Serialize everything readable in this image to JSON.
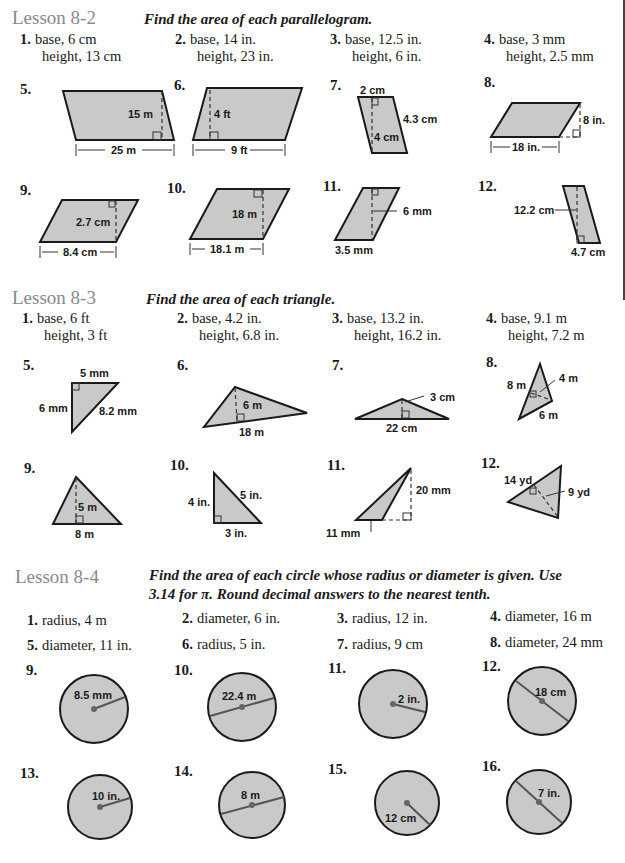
{
  "lessons": [
    {
      "title": "Lesson 8-2",
      "instruction": "Find the area of each parallelogram.",
      "items": [
        {
          "n": "1.",
          "line1": "base, 6 cm",
          "line2": "height, 13 cm"
        },
        {
          "n": "2.",
          "line1": "base, 14 in.",
          "line2": "height, 23 in."
        },
        {
          "n": "3.",
          "line1": "base, 12.5 in.",
          "line2": "height, 6 in."
        },
        {
          "n": "4.",
          "line1": "base, 3 mm",
          "line2": "height, 2.5 mm"
        }
      ],
      "figures": [
        {
          "n": "5.",
          "labels": [
            "15 m",
            "25 m"
          ]
        },
        {
          "n": "6.",
          "labels": [
            "4 ft",
            "9 ft"
          ]
        },
        {
          "n": "7.",
          "labels": [
            "2 cm",
            "4.3 cm",
            "4 cm"
          ]
        },
        {
          "n": "8.",
          "labels": [
            "8 in.",
            "18 in."
          ]
        },
        {
          "n": "9.",
          "labels": [
            "2.7 cm",
            "8.4 cm"
          ]
        },
        {
          "n": "10.",
          "labels": [
            "18 m",
            "18.1 m"
          ]
        },
        {
          "n": "11.",
          "labels": [
            "6 mm",
            "3.5 mm"
          ]
        },
        {
          "n": "12.",
          "labels": [
            "12.2 cm",
            "4.7 cm"
          ]
        }
      ]
    },
    {
      "title": "Lesson 8-3",
      "instruction": "Find the area of each triangle.",
      "items": [
        {
          "n": "1.",
          "line1": "base, 6 ft",
          "line2": "height, 3 ft"
        },
        {
          "n": "2.",
          "line1": "base, 4.2 in.",
          "line2": "height, 6.8 in."
        },
        {
          "n": "3.",
          "line1": "base, 13.2 in.",
          "line2": "height, 16.2 in."
        },
        {
          "n": "4.",
          "line1": "base, 9.1 m",
          "line2": "height, 7.2 m"
        }
      ],
      "figures": [
        {
          "n": "5.",
          "labels": [
            "5 mm",
            "6 mm",
            "8.2 mm"
          ]
        },
        {
          "n": "6.",
          "labels": [
            "6 m",
            "18 m"
          ]
        },
        {
          "n": "7.",
          "labels": [
            "3 cm",
            "22 cm"
          ]
        },
        {
          "n": "8.",
          "labels": [
            "8 m",
            "4 m",
            "6 m"
          ]
        },
        {
          "n": "9.",
          "labels": [
            "5 m",
            "8 m"
          ]
        },
        {
          "n": "10.",
          "labels": [
            "4 in.",
            "5 in.",
            "3 in."
          ]
        },
        {
          "n": "11.",
          "labels": [
            "20 mm",
            "11 mm"
          ]
        },
        {
          "n": "12.",
          "labels": [
            "14 yd",
            "9 yd"
          ]
        }
      ]
    },
    {
      "title": "Lesson 8-4",
      "instruction_line1": "Find the area of each circle whose radius or diameter is given. Use",
      "instruction_line2": "3.14 for π. Round decimal answers to the nearest tenth.",
      "items": [
        {
          "n": "1.",
          "text": "radius, 4 m"
        },
        {
          "n": "2.",
          "text": "diameter, 6 in."
        },
        {
          "n": "3.",
          "text": "radius, 12 in."
        },
        {
          "n": "4.",
          "text": "diameter, 16 m"
        },
        {
          "n": "5.",
          "text": "diameter, 11 in."
        },
        {
          "n": "6.",
          "text": "radius, 5 in."
        },
        {
          "n": "7.",
          "text": "radius, 9 cm"
        },
        {
          "n": "8.",
          "text": "diameter, 24 mm"
        }
      ],
      "figures": [
        {
          "n": "9.",
          "label": "8.5 mm",
          "type": "radius"
        },
        {
          "n": "10.",
          "label": "22.4 m",
          "type": "diameter"
        },
        {
          "n": "11.",
          "label": "2 in.",
          "type": "radius"
        },
        {
          "n": "12.",
          "label": "18 cm",
          "type": "diameter"
        },
        {
          "n": "13.",
          "label": "10 in.",
          "type": "radius"
        },
        {
          "n": "14.",
          "label": "8 m",
          "type": "diameter"
        },
        {
          "n": "15.",
          "label": "12 cm",
          "type": "radius"
        },
        {
          "n": "16.",
          "label": "7 in.",
          "type": "diameter"
        }
      ]
    }
  ],
  "colors": {
    "heading_gray": "#8a8a8a",
    "shape_fill": "#c9c9c9",
    "ink": "#1a1a1a"
  }
}
